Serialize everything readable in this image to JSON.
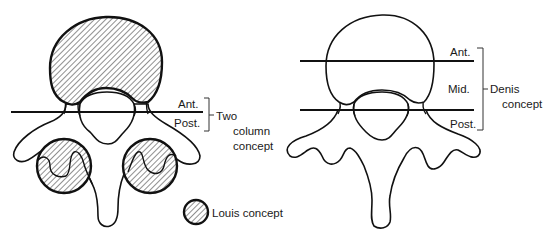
{
  "figure": {
    "left_diagram": {
      "title": "Two column concept",
      "labels": {
        "anterior": "Ant.",
        "posterior": "Post.",
        "concept_line1": "Two",
        "concept_line2": "column",
        "concept_line3": "concept"
      },
      "legend": {
        "swatch": "hatched-circle",
        "label": "Louis concept"
      }
    },
    "right_diagram": {
      "title": "Denis concept",
      "labels": {
        "anterior": "Ant.",
        "middle": "Mid.",
        "posterior": "Post.",
        "concept_line1": "Denis",
        "concept_line2": "concept"
      }
    },
    "colors": {
      "line": "#111111",
      "background": "#ffffff"
    }
  }
}
